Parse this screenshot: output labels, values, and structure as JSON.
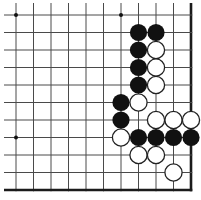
{
  "diagram": {
    "type": "go-board-corner-problem",
    "canvas": {
      "width": 201,
      "height": 200,
      "background": "#ffffff"
    },
    "grid": {
      "visible_cols": 11,
      "visible_rows": 11,
      "first_col_x": 16,
      "first_row_y": 15,
      "spacing": 17.5,
      "line_color": "#4a4a4a",
      "line_width": 1,
      "edge_color": "#1b1b1b",
      "edge_width": 2.6,
      "thick_edges": [
        "right",
        "bottom"
      ],
      "cut_edges": [
        "top",
        "left"
      ],
      "cut_overhang_left_x": 4,
      "cut_overhang_top_y": 3
    },
    "star_points": {
      "color": "#111111",
      "radius": 2,
      "positions": [
        [
          1,
          1
        ],
        [
          7,
          1
        ],
        [
          1,
          8
        ]
      ]
    },
    "stones": {
      "radius": 8.6,
      "black_fill": "#111111",
      "white_fill": "#ffffff",
      "white_stroke": "#222222",
      "white_stroke_width": 1.3,
      "black": [
        [
          8,
          2
        ],
        [
          9,
          2
        ],
        [
          8,
          3
        ],
        [
          8,
          4
        ],
        [
          8,
          5
        ],
        [
          7,
          6
        ],
        [
          7,
          7
        ],
        [
          8,
          8
        ],
        [
          9,
          8
        ],
        [
          10,
          8
        ],
        [
          11,
          8
        ]
      ],
      "white": [
        [
          9,
          3
        ],
        [
          9,
          4
        ],
        [
          9,
          5
        ],
        [
          8,
          6
        ],
        [
          9,
          7
        ],
        [
          10,
          7
        ],
        [
          11,
          7
        ],
        [
          7,
          8
        ],
        [
          8,
          9
        ],
        [
          9,
          9
        ],
        [
          10,
          10
        ]
      ]
    }
  }
}
